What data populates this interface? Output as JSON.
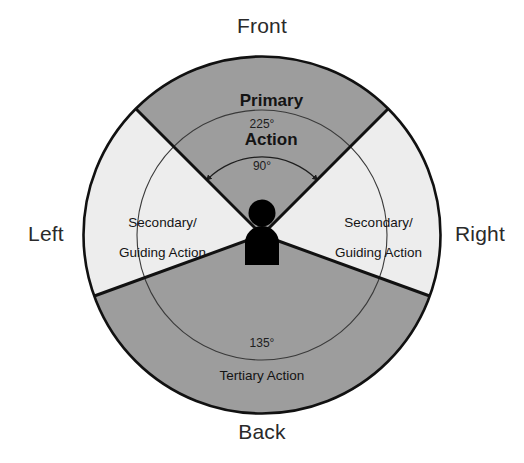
{
  "diagram": {
    "compass": {
      "front": "Front",
      "back": "Back",
      "left": "Left",
      "right": "Right"
    },
    "sectors": [
      {
        "id": "primary",
        "label": "Primary\nAction",
        "label_line1": "Primary",
        "label_line2": "Action",
        "position": "top",
        "fill": "#9d9d9d",
        "start_angle": 45,
        "end_angle": 135
      },
      {
        "id": "secondary-left",
        "label": "Secondary/\nGuiding Action",
        "label_line1": "Secondary/",
        "label_line2": "Guiding Action",
        "position": "left",
        "fill": "#ededed",
        "start_angle": 135,
        "end_angle": 200
      },
      {
        "id": "secondary-right",
        "label": "Secondary/\nGuiding Action",
        "label_line1": "Secondary/",
        "label_line2": "Guiding Action",
        "position": "right",
        "fill": "#ededed",
        "start_angle": 340,
        "end_angle": 45
      },
      {
        "id": "tertiary",
        "label": "Tertiary Action",
        "position": "bottom",
        "fill": "#9d9d9d",
        "start_angle": 200,
        "end_angle": 340
      }
    ],
    "angle_markers": [
      {
        "id": "arc-225",
        "value": "225°",
        "arc_radius": 125,
        "position": "top"
      },
      {
        "id": "arc-90",
        "value": "90°",
        "arc_radius": 78,
        "position": "top-inner"
      },
      {
        "id": "arc-135",
        "value": "135°",
        "arc_radius": 125,
        "position": "bottom"
      }
    ],
    "person": {
      "name": "person-figure",
      "fill": "#000000",
      "center_x": 262,
      "center_y": 235
    },
    "geometry": {
      "center_x": 262,
      "center_y": 235,
      "outer_radius": 179,
      "outline_color": "#111111"
    }
  }
}
